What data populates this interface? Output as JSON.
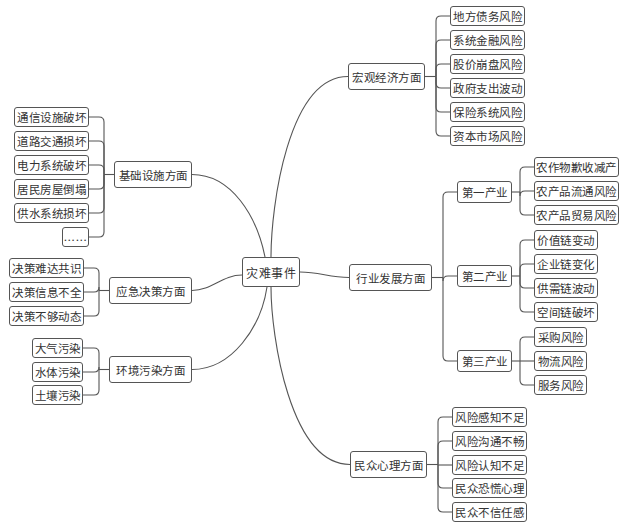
{
  "center": {
    "label": "灾难事件",
    "x": 242,
    "y": 257,
    "w": 58,
    "h": 30
  },
  "branches": [
    {
      "id": "infrastructure",
      "label": "基础设施方面",
      "x": 114,
      "y": 161,
      "w": 78,
      "h": 27,
      "side": "left",
      "leaves": [
        {
          "label": "通信设施破坏",
          "x": 14,
          "y": 107,
          "w": 75
        },
        {
          "label": "道路交通损坏",
          "x": 14,
          "y": 131,
          "w": 75
        },
        {
          "label": "电力系统破坏",
          "x": 14,
          "y": 155,
          "w": 75
        },
        {
          "label": "居民房屋倒塌",
          "x": 14,
          "y": 179,
          "w": 75
        },
        {
          "label": "供水系统损坏",
          "x": 14,
          "y": 203,
          "w": 75
        },
        {
          "label": "……",
          "x": 62,
          "y": 227,
          "w": 27
        }
      ]
    },
    {
      "id": "emergency-decision",
      "label": "应急决策方面",
      "x": 109,
      "y": 277,
      "w": 83,
      "h": 27,
      "side": "left",
      "leaves": [
        {
          "label": "决策难达共识",
          "x": 9,
          "y": 258,
          "w": 75
        },
        {
          "label": "决策信息不全",
          "x": 9,
          "y": 282,
          "w": 75
        },
        {
          "label": "决策不够动态",
          "x": 9,
          "y": 306,
          "w": 75
        }
      ]
    },
    {
      "id": "environment",
      "label": "环境污染方面",
      "x": 109,
      "y": 356,
      "w": 83,
      "h": 27,
      "side": "left",
      "leaves": [
        {
          "label": "大气污染",
          "x": 32,
          "y": 338,
          "w": 51
        },
        {
          "label": "水体污染",
          "x": 32,
          "y": 362,
          "w": 51
        },
        {
          "label": "土壤污染",
          "x": 32,
          "y": 385,
          "w": 51
        }
      ]
    },
    {
      "id": "macro-economy",
      "label": "宏观经济方面",
      "x": 348,
      "y": 63,
      "w": 77,
      "h": 27,
      "side": "right",
      "leaves": [
        {
          "label": "地方债务风险",
          "x": 450,
          "y": 6,
          "w": 75
        },
        {
          "label": "系统金融风险",
          "x": 450,
          "y": 30,
          "w": 75
        },
        {
          "label": "股价崩盘风险",
          "x": 450,
          "y": 54,
          "w": 75
        },
        {
          "label": "政府支出波动",
          "x": 450,
          "y": 78,
          "w": 75
        },
        {
          "label": "保险系统风险",
          "x": 450,
          "y": 102,
          "w": 75
        },
        {
          "label": "资本市场风险",
          "x": 450,
          "y": 126,
          "w": 75
        }
      ]
    },
    {
      "id": "industry",
      "label": "行业发展方面",
      "x": 349,
      "y": 264,
      "w": 83,
      "h": 27,
      "side": "right",
      "subs": [
        {
          "label": "第一产业",
          "x": 457,
          "y": 181,
          "w": 55,
          "leaves": [
            {
              "label": "农作物歉收减产",
              "x": 534,
              "y": 157,
              "w": 85
            },
            {
              "label": "农产品流通风险",
              "x": 534,
              "y": 181,
              "w": 85
            },
            {
              "label": "农产品贸易风险",
              "x": 534,
              "y": 205,
              "w": 85
            }
          ]
        },
        {
          "label": "第二产业",
          "x": 457,
          "y": 265,
          "w": 55,
          "leaves": [
            {
              "label": "价值链变动",
              "x": 534,
              "y": 230,
              "w": 64
            },
            {
              "label": "企业链变化",
              "x": 534,
              "y": 254,
              "w": 64
            },
            {
              "label": "供需链波动",
              "x": 534,
              "y": 278,
              "w": 64
            },
            {
              "label": "空间链破坏",
              "x": 534,
              "y": 302,
              "w": 64
            }
          ]
        },
        {
          "label": "第三产业",
          "x": 457,
          "y": 350,
          "w": 55,
          "leaves": [
            {
              "label": "采购风险",
              "x": 534,
              "y": 327,
              "w": 53
            },
            {
              "label": "物流风险",
              "x": 534,
              "y": 351,
              "w": 53
            },
            {
              "label": "服务风险",
              "x": 534,
              "y": 375,
              "w": 53
            }
          ]
        }
      ]
    },
    {
      "id": "public-psychology",
      "label": "民众心理方面",
      "x": 350,
      "y": 451,
      "w": 77,
      "h": 27,
      "side": "right",
      "leaves": [
        {
          "label": "风险感知不足",
          "x": 452,
          "y": 407,
          "w": 75
        },
        {
          "label": "风险沟通不畅",
          "x": 452,
          "y": 431,
          "w": 75
        },
        {
          "label": "风险认知不足",
          "x": 452,
          "y": 455,
          "w": 75
        },
        {
          "label": "民众恐慌心理",
          "x": 452,
          "y": 478,
          "w": 75
        },
        {
          "label": "民众不信任感",
          "x": 452,
          "y": 502,
          "w": 75
        }
      ]
    }
  ],
  "colors": {
    "line": "#555555",
    "border": "#555555",
    "text": "#333333",
    "background": "#ffffff"
  }
}
